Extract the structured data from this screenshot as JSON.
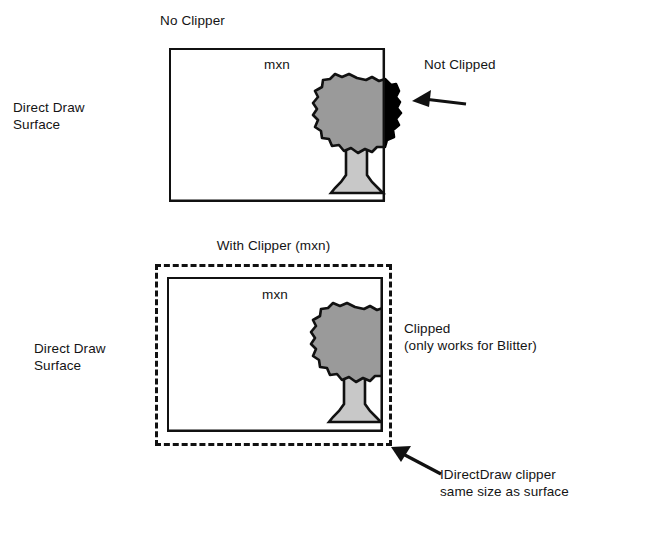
{
  "page": {
    "background": "#ffffff",
    "ink": "#111111",
    "crown_gray": "#9a9a9a",
    "crown_black": "#000000",
    "trunk_gray": "#c8c8c8",
    "width": 651,
    "height": 537
  },
  "diagram_top": {
    "title": "No Clipper",
    "surface_label": "Direct Draw\nSurface",
    "inner_label": "mxn",
    "callout": "Not Clipped",
    "surface_rect": {
      "x": 169,
      "y": 48,
      "w": 216,
      "h": 154
    },
    "tree": {
      "name": "tree-sprite",
      "crown_center_x": 357,
      "crown_center_y": 115,
      "clip_edge_x": 385,
      "inside_fill": "#9a9a9a",
      "outside_fill": "#000000",
      "trunk_fill": "#c8c8c8"
    },
    "arrow": {
      "from_x": 466,
      "from_y": 104,
      "to_x": 414,
      "to_y": 101
    }
  },
  "diagram_bottom": {
    "title": "With Clipper (mxn)",
    "surface_label": "Direct Draw\nSurface",
    "inner_label": "mxn",
    "callout_line1": "Clipped",
    "callout_line2": "(only works for Blitter)",
    "note_line1": "IDirectDraw clipper",
    "note_line2": "same size as surface",
    "clipper_rect": {
      "x": 155,
      "y": 264,
      "w": 237,
      "h": 182,
      "style": "dashed"
    },
    "surface_rect": {
      "x": 167,
      "y": 277,
      "w": 216,
      "h": 155
    },
    "tree": {
      "name": "tree-sprite-clipped",
      "crown_center_x": 355,
      "crown_center_y": 344,
      "clip_edge_x": 383,
      "inside_fill": "#9a9a9a",
      "trunk_fill": "#c8c8c8"
    },
    "arrow": {
      "from_x": 441,
      "from_y": 474,
      "to_x": 392,
      "to_y": 447
    }
  }
}
